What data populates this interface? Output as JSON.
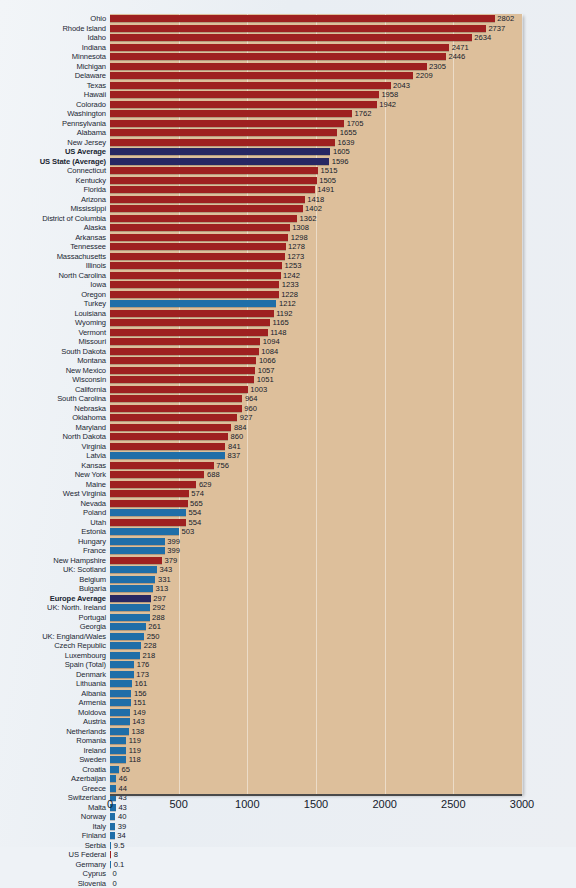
{
  "chart_data": {
    "type": "bar",
    "orientation": "horizontal",
    "title": "",
    "xlabel": "",
    "ylabel": "",
    "xlim": [
      0,
      3000
    ],
    "xticks": [
      "0",
      "500",
      "1000",
      "1500",
      "2000",
      "2500",
      "3000"
    ],
    "grid": true,
    "legend": null,
    "series_colors": {
      "us_state": "#9e2020",
      "europe": "#1f6ea8",
      "average": "#272763",
      "plot_background": "#ddbf9b"
    },
    "categories": [
      "Ohio",
      "Rhode Island",
      "Idaho",
      "Indiana",
      "Minnesota",
      "Michigan",
      "Delaware",
      "Texas",
      "Hawaii",
      "Colorado",
      "Washington",
      "Pennsylvania",
      "Alabama",
      "New Jersey",
      "US Average",
      "US State (Average)",
      "Connecticut",
      "Kentucky",
      "Florida",
      "Arizona",
      "Mississippi",
      "District of Columbia",
      "Alaska",
      "Arkansas",
      "Tennessee",
      "Massachusetts",
      "Illinois",
      "North Carolina",
      "Iowa",
      "Oregon",
      "Turkey",
      "Louisiana",
      "Wyoming",
      "Vermont",
      "Missouri",
      "South Dakota",
      "Montana",
      "New Mexico",
      "Wisconsin",
      "California",
      "South Carolina",
      "Nebraska",
      "Oklahoma",
      "Maryland",
      "North Dakota",
      "Virginia",
      "Latvia",
      "Kansas",
      "New York",
      "Maine",
      "West Virginia",
      "Nevada",
      "Poland",
      "Utah",
      "Estonia",
      "Hungary",
      "France",
      "New Hampshire",
      "UK: Scotland",
      "Belgium",
      "Bulgaria",
      "Europe Average",
      "UK: North. Ireland",
      "Portugal",
      "Georgia",
      "UK: England/Wales",
      "Czech Republic",
      "Luxembourg",
      "Spain (Total)",
      "Denmark",
      "Lithuania",
      "Albania",
      "Armenia",
      "Moldova",
      "Austria",
      "Netherlands",
      "Romania",
      "Ireland",
      "Sweden",
      "Croatia",
      "Azerbaijan",
      "Greece",
      "Switzerland",
      "Malta",
      "Norway",
      "Italy",
      "Finland",
      "Serbia",
      "US Federal",
      "Germany",
      "Cyprus",
      "Slovenia"
    ],
    "values": [
      2802,
      2737,
      2634,
      2471,
      2446,
      2305,
      2209,
      2043,
      1958,
      1942,
      1762,
      1705,
      1655,
      1639,
      1605,
      1596,
      1515,
      1505,
      1491,
      1418,
      1402,
      1362,
      1308,
      1298,
      1278,
      1273,
      1253,
      1242,
      1233,
      1228,
      1212,
      1192,
      1165,
      1148,
      1094,
      1084,
      1066,
      1057,
      1051,
      1003,
      964,
      960,
      927,
      884,
      860,
      841,
      837,
      756,
      688,
      629,
      574,
      565,
      554,
      554,
      503,
      399,
      399,
      379,
      343,
      331,
      313,
      297,
      292,
      288,
      261,
      250,
      228,
      218,
      176,
      173,
      161,
      156,
      151,
      149,
      143,
      138,
      119,
      119,
      118,
      65,
      46,
      44,
      43,
      43,
      40,
      39,
      34,
      9.5,
      8,
      0.1,
      0,
      0
    ],
    "value_labels": [
      "2802",
      "2737",
      "2634",
      "2471",
      "2446",
      "2305",
      "2209",
      "2043",
      "1958",
      "1942",
      "1762",
      "1705",
      "1655",
      "1639",
      "1605",
      "1596",
      "1515",
      "1505",
      "1491",
      "1418",
      "1402",
      "1362",
      "1308",
      "1298",
      "1278",
      "1273",
      "1253",
      "1242",
      "1233",
      "1228",
      "1212",
      "1192",
      "1165",
      "1148",
      "1094",
      "1084",
      "1066",
      "1057",
      "1051",
      "1003",
      "964",
      "960",
      "927",
      "884",
      "860",
      "841",
      "837",
      "756",
      "688",
      "629",
      "574",
      "565",
      "554",
      "554",
      "503",
      "399",
      "399",
      "379",
      "343",
      "331",
      "313",
      "297",
      "292",
      "288",
      "261",
      "250",
      "228",
      "218",
      "176",
      "173",
      "161",
      "156",
      "151",
      "149",
      "143",
      "138",
      "119",
      "119",
      "118",
      "65",
      "46",
      "44",
      "43",
      "43",
      "40",
      "39",
      "34",
      "9.5",
      "8",
      "0.1",
      "0",
      "0"
    ],
    "groups": [
      "us",
      "us",
      "us",
      "us",
      "us",
      "us",
      "us",
      "us",
      "us",
      "us",
      "us",
      "us",
      "us",
      "us",
      "avg",
      "avg",
      "us",
      "us",
      "us",
      "us",
      "us",
      "us",
      "us",
      "us",
      "us",
      "us",
      "us",
      "us",
      "us",
      "us",
      "eu",
      "us",
      "us",
      "us",
      "us",
      "us",
      "us",
      "us",
      "us",
      "us",
      "us",
      "us",
      "us",
      "us",
      "us",
      "us",
      "eu",
      "us",
      "us",
      "us",
      "us",
      "us",
      "eu",
      "us",
      "eu",
      "eu",
      "eu",
      "us",
      "eu",
      "eu",
      "eu",
      "avg",
      "eu",
      "eu",
      "eu",
      "eu",
      "eu",
      "eu",
      "eu",
      "eu",
      "eu",
      "eu",
      "eu",
      "eu",
      "eu",
      "eu",
      "eu",
      "eu",
      "eu",
      "eu",
      "eu",
      "eu",
      "eu",
      "eu",
      "eu",
      "eu",
      "eu",
      "eu",
      "us",
      "eu",
      "eu",
      "eu"
    ]
  }
}
